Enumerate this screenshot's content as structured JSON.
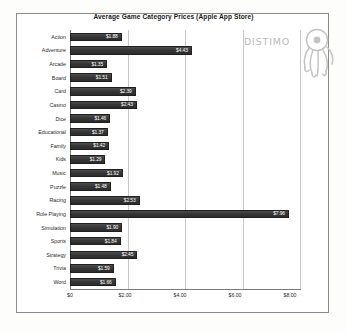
{
  "chart_data": {
    "type": "bar",
    "orientation": "horizontal",
    "title": "Average Game Category Prices (Apple App Store)",
    "xlabel": "",
    "ylabel": "",
    "xlim": [
      0,
      8.4
    ],
    "grid": true,
    "legend": null,
    "xticks": [
      "$0",
      "$2.00",
      "$4.00",
      "$6.00",
      "$8.00"
    ],
    "xtick_values": [
      0,
      2,
      4,
      6,
      8
    ],
    "categories": [
      "Action",
      "Adventure",
      "Arcade",
      "Board",
      "Card",
      "Casino",
      "Dice",
      "Educational",
      "Family",
      "Kids",
      "Music",
      "Puzzle",
      "Racing",
      "Role Playing",
      "Simulation",
      "Sports",
      "Strategy",
      "Trivia",
      "Word"
    ],
    "values": [
      1.88,
      4.43,
      1.35,
      1.51,
      2.39,
      2.43,
      1.46,
      1.37,
      1.42,
      1.29,
      1.92,
      1.48,
      2.53,
      7.96,
      1.9,
      1.84,
      2.45,
      1.59,
      1.66
    ],
    "data_labels": [
      "$1.88",
      "$4.43",
      "$1.35",
      "$1.51",
      "$2.39",
      "$2.43",
      "$1.46",
      "$1.37",
      "$1.42",
      "$1.29",
      "$1.92",
      "$1.48",
      "$2.53",
      "$7.96",
      "$1.90",
      "$1.84",
      "$2.45",
      "$1.59",
      "$1.66"
    ],
    "bar_color": "#373737",
    "label_color": "#ffffff",
    "grid_color": "#c9c9c9"
  },
  "branding": {
    "wordmark": "DISTIMO"
  }
}
